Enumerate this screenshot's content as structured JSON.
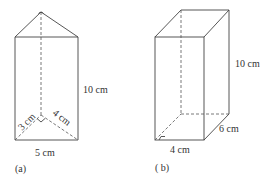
{
  "figure_a": {
    "caption": "(a)",
    "shape": "triangular prism",
    "labels": {
      "height": "10 cm",
      "base": "5 cm",
      "leg_left": "3 cm",
      "leg_right": "4 cm"
    },
    "right_angle_marker": true
  },
  "figure_b": {
    "caption": "( b)",
    "shape": "rectangular prism",
    "labels": {
      "height": "10 cm",
      "width": "4 cm",
      "depth": "6 cm"
    },
    "right_angle_marker": true
  }
}
